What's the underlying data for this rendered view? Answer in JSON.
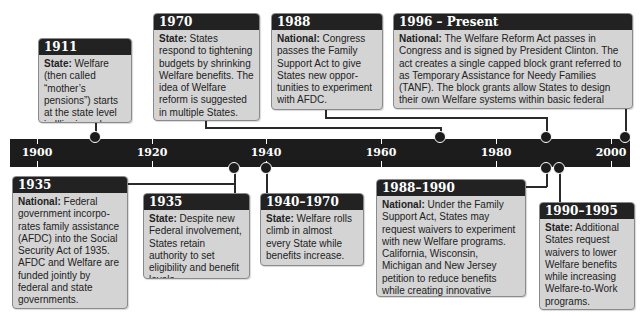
{
  "timeline": {
    "ticks": [
      {
        "label": "1900",
        "x": 37
      },
      {
        "label": "1920",
        "x": 152
      },
      {
        "label": "1940",
        "x": 266
      },
      {
        "label": "1960",
        "x": 381
      },
      {
        "label": "1980",
        "x": 496
      },
      {
        "label": "2000",
        "x": 611
      }
    ]
  },
  "events_above": [
    {
      "year": "1911",
      "lead": "State:",
      "text": " Welfare (then called “mother’s pensions”) starts at the state level in Illinois and Missouri."
    },
    {
      "year": "1970",
      "lead": "State:",
      "text": " States respond to tightening budgets by shrinking Welfare benefits. The idea of Welfare reform is suggested in multiple States."
    },
    {
      "year": "1988",
      "lead": "National:",
      "text": " Congress passes the Family Support Act to give States new oppor-tunities to experiment with AFDC."
    },
    {
      "year": "1996 – Present",
      "lead": "National:",
      "text": " The Welfare Reform Act passes in Congress and is signed by President Clinton. The act creates a single capped block grant referred to as Temporary Assistance for Needy Families (TANF). The block grants allow States to design their own Welfare systems within basic federal requirements."
    }
  ],
  "events_below": [
    {
      "year": "1935",
      "lead": "National:",
      "text": " Federal government incorpo-rates family assistance (AFDC) into the Social Security Act of 1935. AFDC and Welfare are funded jointly by federal and state governments."
    },
    {
      "year": "1935",
      "lead": "State:",
      "text": " Despite new Federal involvement, States retain authority to set eligibility and benefit levels."
    },
    {
      "year": "1940–1970",
      "lead": "State:",
      "text": " Welfare rolls climb in almost every State while benefits increase."
    },
    {
      "year": "1988–1990",
      "lead": "National:",
      "text": " Under the Family Support Act, States may request waivers to experiment with new Welfare programs. California, Wisconsin, Michigan and New Jersey petition to reduce benefits while creating innovative Welfare–to-work programs."
    },
    {
      "year": "1990–1995",
      "lead": "State:",
      "text": " Additional States request waivers to lower Welfare benefits while increasing Welfare-to-Work programs."
    }
  ],
  "colors": {
    "bar": "#1c1c1c",
    "box_fill": "#d4d4d4",
    "header": "#222222"
  }
}
